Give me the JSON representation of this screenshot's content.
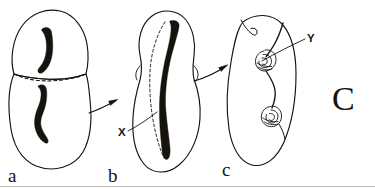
{
  "figure": {
    "figure_letter": "C",
    "background_color": "#ffffff",
    "ink_color": "#16130f",
    "width": 375,
    "height": 189
  },
  "panels": [
    {
      "id": "panel-a",
      "label": "a",
      "label_x": 8,
      "label_y": 182,
      "description": "Two-lobed cell divided by a dashed septum, each lobe containing a dark curved body"
    },
    {
      "id": "panel-b",
      "label": "b",
      "label_x": 108,
      "label_y": 182,
      "description": "Elongated peanut-shaped cell with a single long dark body and a dashed curve beside it"
    },
    {
      "id": "panel-c",
      "label": "c",
      "label_x": 222,
      "label_y": 176,
      "description": "Oval cell containing a filament linking two coiled spiral bodies"
    }
  ],
  "annotations": [
    {
      "id": "label-x",
      "text": "X",
      "text_x": 118,
      "text_y": 132,
      "points_to": "dashed curve in panel b"
    },
    {
      "id": "label-y",
      "text": "Y",
      "text_x": 310,
      "text_y": 39,
      "points_to": "upper coiled body in panel c"
    }
  ],
  "arrows": [
    {
      "id": "arrow-a-to-b",
      "from": "panel-a",
      "to": "panel-b"
    },
    {
      "id": "arrow-b-to-c",
      "from": "panel-b",
      "to": "panel-c"
    }
  ]
}
